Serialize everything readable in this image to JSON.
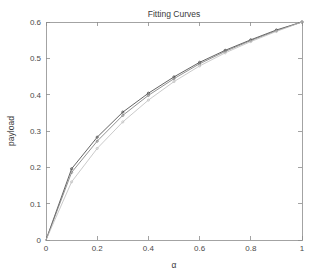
{
  "chart_data": {
    "type": "line",
    "title": "Fitting Curves",
    "xlabel": "α",
    "ylabel": "payload",
    "xlim": [
      0,
      1
    ],
    "ylim": [
      0,
      0.6
    ],
    "grid": false,
    "legend": "none",
    "xticks": [
      "0",
      "0.2",
      "0.4",
      "0.6",
      "0.8",
      "1"
    ],
    "xtick_values": [
      0,
      0.2,
      0.4,
      0.6,
      0.8,
      1
    ],
    "yticks": [
      "0",
      "0.1",
      "0.2",
      "0.3",
      "0.4",
      "0.5",
      "0.6"
    ],
    "ytick_values": [
      0,
      0.1,
      0.2,
      0.3,
      0.4,
      0.5,
      0.6
    ],
    "x": [
      0,
      0.1,
      0.2,
      0.3,
      0.4,
      0.5,
      0.6,
      0.7,
      0.8,
      0.9,
      1
    ],
    "series": [
      {
        "name": "curve-1",
        "color": "#3c3c3c",
        "marker": "dot",
        "values": [
          0,
          0.196,
          0.283,
          0.352,
          0.404,
          0.449,
          0.489,
          0.522,
          0.551,
          0.578,
          0.6
        ]
      },
      {
        "name": "curve-2",
        "color": "#777777",
        "marker": "dot",
        "values": [
          0,
          0.186,
          0.272,
          0.343,
          0.398,
          0.444,
          0.485,
          0.519,
          0.549,
          0.576,
          0.6
        ]
      },
      {
        "name": "curve-3",
        "color": "#bcbcbc",
        "marker": "dot",
        "values": [
          0,
          0.16,
          0.252,
          0.325,
          0.385,
          0.436,
          0.479,
          0.515,
          0.546,
          0.574,
          0.6
        ]
      }
    ]
  },
  "axes": {
    "box_color": "#8c8c8c",
    "background": "#ffffff"
  }
}
